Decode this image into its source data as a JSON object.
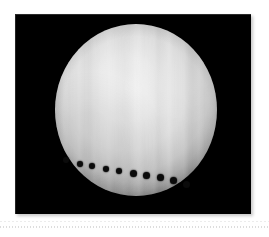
{
  "figure": {
    "kind": "astronomical-photograph",
    "caption": "",
    "alt_label": "Transit sequence across a bright planetary disc",
    "frame": {
      "background_color": "#000000",
      "left": 15,
      "top": 14,
      "width": 236,
      "height": 200
    },
    "page_background_color": "#ffffff"
  },
  "chart_data": {
    "type": "scatter",
    "title": "",
    "subtitle": "",
    "xlabel": "",
    "ylabel": "",
    "grid": false,
    "legend_position": "none",
    "xlim": [
      0,
      236
    ],
    "ylim": [
      0,
      200
    ],
    "background": "#000000",
    "disc": {
      "name": "planetary-disc",
      "center_x": 121,
      "center_y": 96,
      "radius_x": 81,
      "radius_y": 86,
      "fill_color": "#e8e8e8",
      "rim_color": "#1d1d1d",
      "banding": "vertical striations",
      "band_count": 12
    },
    "series": [
      {
        "name": "transit-dots",
        "marker": "filled-circle",
        "color": "#0b0b0b",
        "count": 10,
        "points": [
          {
            "x": 51,
            "y": 146,
            "r": 3.0
          },
          {
            "x": 65,
            "y": 150,
            "r": 3.2
          },
          {
            "x": 77,
            "y": 152,
            "r": 3.2
          },
          {
            "x": 91,
            "y": 155,
            "r": 3.4
          },
          {
            "x": 104,
            "y": 157,
            "r": 3.4
          },
          {
            "x": 118,
            "y": 159,
            "r": 3.5
          },
          {
            "x": 131,
            "y": 161,
            "r": 3.5
          },
          {
            "x": 145,
            "y": 163,
            "r": 3.5
          },
          {
            "x": 158,
            "y": 166,
            "r": 3.5
          },
          {
            "x": 171,
            "y": 170,
            "r": 3.5
          }
        ]
      }
    ]
  },
  "bottom_rule": {
    "name": "dotted-separator",
    "color": "#d9d9d9",
    "y": 226,
    "style": "dotted"
  }
}
